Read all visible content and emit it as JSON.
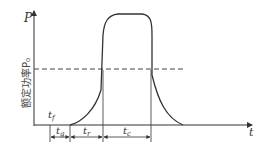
{
  "diagram": {
    "axes": {
      "y_label": "P",
      "x_label": "t",
      "y_axis_title": "额定功率P₀"
    },
    "reference_line": {
      "label": "额定功率P₀",
      "style": "dashed"
    },
    "annotations": {
      "tf": "t",
      "tf_sub": "f",
      "tg": "t",
      "tg_sub": "g",
      "tr": "t",
      "tr_sub": "r",
      "tc": "t",
      "tc_sub": "c"
    },
    "colors": {
      "curve": "#333333",
      "axis": "#333333",
      "dashed": "#444444"
    }
  }
}
